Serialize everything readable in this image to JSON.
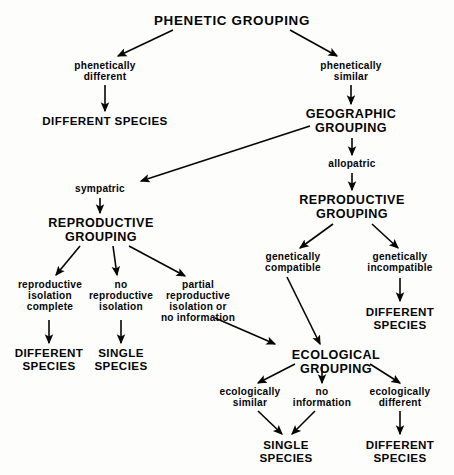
{
  "diagram": {
    "title": "PHENETIC GROUPING",
    "type": "flowchart",
    "colors": {
      "background": "#fdfdfb",
      "ink": "#050505"
    },
    "nodes": [
      {
        "id": "phenetic_grouping",
        "label": "PHENETIC GROUPING",
        "kind": "grouping",
        "x": 232,
        "y": 14,
        "style": "title"
      },
      {
        "id": "phenetically_different",
        "label": "phenetically\ndifferent",
        "kind": "condition",
        "x": 105,
        "y": 61,
        "style": "low"
      },
      {
        "id": "phenetically_similar",
        "label": "phenetically\nsimilar",
        "kind": "condition",
        "x": 351,
        "y": 61,
        "style": "low"
      },
      {
        "id": "different_species_1",
        "label": "DIFFERENT SPECIES",
        "kind": "result",
        "x": 105,
        "y": 115,
        "style": "cap-sm"
      },
      {
        "id": "geographic_grouping",
        "label": "GEOGRAPHIC\nGROUPING",
        "kind": "grouping",
        "x": 351,
        "y": 108,
        "style": "cap"
      },
      {
        "id": "allopatric",
        "label": "allopatric",
        "kind": "condition",
        "x": 352,
        "y": 159,
        "style": "low"
      },
      {
        "id": "sympatric",
        "label": "sympatric",
        "kind": "condition",
        "x": 100,
        "y": 184,
        "style": "low"
      },
      {
        "id": "reproductive_grouping_right",
        "label": "REPRODUCTIVE\nGROUPING",
        "kind": "grouping",
        "x": 352,
        "y": 194,
        "style": "cap"
      },
      {
        "id": "reproductive_grouping_left",
        "label": "REPRODUCTIVE\nGROUPING",
        "kind": "grouping",
        "x": 101,
        "y": 217,
        "style": "cap"
      },
      {
        "id": "reproductive_isolation_complete",
        "label": "reproductive\nisolation\ncomplete",
        "kind": "condition",
        "x": 50,
        "y": 280,
        "style": "low"
      },
      {
        "id": "no_reproductive_isolation",
        "label": "no\nreproductive\nisolation",
        "kind": "condition",
        "x": 121,
        "y": 280,
        "style": "low"
      },
      {
        "id": "partial_reproductive_isolation",
        "label": "partial\nreproductive\nisolation or\nno information",
        "kind": "condition",
        "x": 198,
        "y": 280,
        "style": "low"
      },
      {
        "id": "genetically_compatible",
        "label": "genetically\ncompatible",
        "kind": "condition",
        "x": 293,
        "y": 252,
        "style": "low"
      },
      {
        "id": "genetically_incompatible",
        "label": "genetically\nincompatible",
        "kind": "condition",
        "x": 400,
        "y": 252,
        "style": "low"
      },
      {
        "id": "different_species_2",
        "label": "DIFFERENT\nSPECIES",
        "kind": "result",
        "x": 400,
        "y": 306,
        "style": "cap-sm"
      },
      {
        "id": "different_species_3",
        "label": "DIFFERENT\nSPECIES",
        "kind": "result",
        "x": 49,
        "y": 347,
        "style": "cap-sm"
      },
      {
        "id": "single_species_1",
        "label": "SINGLE\nSPECIES",
        "kind": "result",
        "x": 121,
        "y": 347,
        "style": "cap-sm"
      },
      {
        "id": "ecological_grouping",
        "label": "ECOLOGICAL GROUPING",
        "kind": "grouping",
        "x": 336,
        "y": 349,
        "style": "cap"
      },
      {
        "id": "ecologically_similar",
        "label": "ecologically\nsimilar",
        "kind": "condition",
        "x": 250,
        "y": 387,
        "style": "low"
      },
      {
        "id": "no_information",
        "label": "no\ninformation",
        "kind": "condition",
        "x": 322,
        "y": 387,
        "style": "low"
      },
      {
        "id": "ecologically_different",
        "label": "ecologically\ndifferent",
        "kind": "condition",
        "x": 400,
        "y": 387,
        "style": "low"
      },
      {
        "id": "single_species_2",
        "label": "SINGLE\nSPECIES",
        "kind": "result",
        "x": 286,
        "y": 439,
        "style": "cap-sm"
      },
      {
        "id": "different_species_4",
        "label": "DIFFERENT\nSPECIES",
        "kind": "result",
        "x": 400,
        "y": 439,
        "style": "cap-sm"
      }
    ],
    "edges": [
      {
        "from": "phenetic_grouping",
        "to": "phenetically_different",
        "x1": 173,
        "y1": 30,
        "x2": 118,
        "y2": 56
      },
      {
        "from": "phenetic_grouping",
        "to": "phenetically_similar",
        "x1": 290,
        "y1": 30,
        "x2": 337,
        "y2": 56
      },
      {
        "from": "phenetically_different",
        "to": "different_species_1",
        "x1": 105,
        "y1": 85,
        "x2": 105,
        "y2": 111
      },
      {
        "from": "phenetically_similar",
        "to": "geographic_grouping",
        "x1": 351,
        "y1": 85,
        "x2": 351,
        "y2": 104
      },
      {
        "from": "geographic_grouping",
        "to": "sympatric",
        "x1": 310,
        "y1": 126,
        "x2": 141,
        "y2": 181
      },
      {
        "from": "geographic_grouping",
        "to": "allopatric",
        "x1": 352,
        "y1": 138,
        "x2": 352,
        "y2": 155
      },
      {
        "from": "allopatric",
        "to": "reproductive_grouping_right",
        "x1": 352,
        "y1": 173,
        "x2": 352,
        "y2": 190
      },
      {
        "from": "sympatric",
        "to": "reproductive_grouping_left",
        "x1": 100,
        "y1": 198,
        "x2": 100,
        "y2": 213
      },
      {
        "from": "reproductive_grouping_left",
        "to": "reproductive_isolation_complete",
        "x1": 80,
        "y1": 246,
        "x2": 56,
        "y2": 275
      },
      {
        "from": "reproductive_grouping_left",
        "to": "no_reproductive_isolation",
        "x1": 113,
        "y1": 246,
        "x2": 117,
        "y2": 275
      },
      {
        "from": "reproductive_grouping_left",
        "to": "partial_reproductive_isolation",
        "x1": 129,
        "y1": 246,
        "x2": 185,
        "y2": 276
      },
      {
        "from": "reproductive_grouping_right",
        "to": "genetically_compatible",
        "x1": 333,
        "y1": 224,
        "x2": 300,
        "y2": 248
      },
      {
        "from": "reproductive_grouping_right",
        "to": "genetically_incompatible",
        "x1": 372,
        "y1": 224,
        "x2": 398,
        "y2": 248
      },
      {
        "from": "genetically_incompatible",
        "to": "different_species_2",
        "x1": 400,
        "y1": 278,
        "x2": 400,
        "y2": 301
      },
      {
        "from": "reproductive_isolation_complete",
        "to": "different_species_3",
        "x1": 49,
        "y1": 320,
        "x2": 49,
        "y2": 343
      },
      {
        "from": "no_reproductive_isolation",
        "to": "single_species_1",
        "x1": 121,
        "y1": 320,
        "x2": 121,
        "y2": 343
      },
      {
        "from": "partial_reproductive_isolation",
        "to": "ecological_grouping",
        "x1": 215,
        "y1": 318,
        "x2": 275,
        "y2": 344
      },
      {
        "from": "genetically_compatible",
        "to": "ecological_grouping",
        "x1": 287,
        "y1": 277,
        "x2": 320,
        "y2": 344
      },
      {
        "from": "ecological_grouping",
        "to": "ecologically_similar",
        "x1": 295,
        "y1": 364,
        "x2": 258,
        "y2": 383
      },
      {
        "from": "ecological_grouping",
        "to": "no_information",
        "x1": 322,
        "y1": 364,
        "x2": 322,
        "y2": 383
      },
      {
        "from": "ecological_grouping",
        "to": "ecologically_different",
        "x1": 370,
        "y1": 364,
        "x2": 400,
        "y2": 383
      },
      {
        "from": "ecologically_similar",
        "to": "single_species_2",
        "x1": 258,
        "y1": 411,
        "x2": 282,
        "y2": 434
      },
      {
        "from": "no_information",
        "to": "single_species_2",
        "x1": 315,
        "y1": 411,
        "x2": 292,
        "y2": 434
      },
      {
        "from": "ecologically_different",
        "to": "different_species_4",
        "x1": 400,
        "y1": 411,
        "x2": 400,
        "y2": 434
      }
    ]
  }
}
